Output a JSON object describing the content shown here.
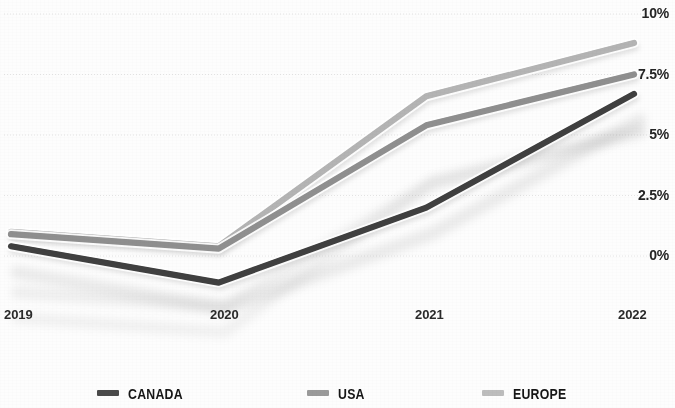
{
  "chart_data": {
    "type": "line",
    "title": "",
    "subtitle": "",
    "xlabel": "",
    "ylabel": "",
    "categories": [
      "2019",
      "2020",
      "2021",
      "2022"
    ],
    "x_tick_labels": [
      "2019",
      "2020",
      "2021",
      "2022"
    ],
    "y_tick_labels": [
      "0%",
      "2.5%",
      "5%",
      "7.5%",
      "10%"
    ],
    "y_tick_values": [
      0,
      2.5,
      5,
      7.5,
      10
    ],
    "ylim": [
      -1.5,
      10
    ],
    "grid": "horizontal",
    "legend_position": "bottom",
    "value_suffix": "%",
    "series": [
      {
        "name": "CANADA",
        "color": "#3f3f3f",
        "values": [
          0.4,
          -1.1,
          2.0,
          6.7
        ]
      },
      {
        "name": "USA",
        "color": "#8f8f8f",
        "values": [
          0.9,
          0.3,
          5.4,
          7.5
        ]
      },
      {
        "name": "EUROPE",
        "color": "#b4b4b4",
        "values": [
          1.0,
          0.4,
          6.6,
          8.8
        ]
      }
    ]
  },
  "axis": {
    "y_ticks": [
      {
        "label": "10%",
        "value": 10
      },
      {
        "label": "7.5%",
        "value": 7.5
      },
      {
        "label": "5%",
        "value": 5
      },
      {
        "label": "2.5%",
        "value": 2.5
      },
      {
        "label": "0%",
        "value": 0
      }
    ],
    "x_ticks": [
      {
        "label": "2019"
      },
      {
        "label": "2020"
      },
      {
        "label": "2021"
      },
      {
        "label": "2022"
      }
    ]
  },
  "legend": {
    "items": [
      {
        "label": "CANADA",
        "color": "#4a4a4a",
        "icon": "line-swatch-icon"
      },
      {
        "label": "USA",
        "color": "#9a9a9a",
        "icon": "line-swatch-icon"
      },
      {
        "label": "EUROPE",
        "color": "#bdbdbd",
        "icon": "line-swatch-icon"
      }
    ]
  },
  "colors": {
    "background": "#fdfdfd",
    "gridline": "#d8d8d8",
    "tick_text": "#252525",
    "canada": "#3f3f3f",
    "usa": "#8f8f8f",
    "europe": "#b4b4b4"
  }
}
